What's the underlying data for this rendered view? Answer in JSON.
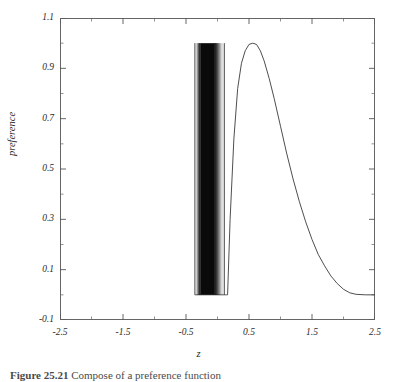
{
  "figure": {
    "caption_label": "Figure 25.21",
    "caption_text": "Compose of a preference function"
  },
  "axes": {
    "xlabel": "z",
    "ylabel": "preference",
    "x_ticks": [
      "-2.5",
      "-1.5",
      "-0.5",
      "0.5",
      "1.5",
      "2.5"
    ],
    "y_ticks": [
      "1.1",
      "0.9",
      "0.7",
      "0.5",
      "0.3",
      "0.1",
      "-0.1"
    ],
    "line_color": "#333333",
    "frame_color": "#555555"
  },
  "chart_data": {
    "type": "line",
    "title": "",
    "subtitle": "",
    "xlabel": "z",
    "ylabel": "preference",
    "xlim": [
      -2.5,
      2.5
    ],
    "ylim": [
      -0.1,
      1.1
    ],
    "xticks": [
      -2.5,
      -1.5,
      -0.5,
      0.5,
      1.5,
      2.5
    ],
    "yticks": [
      -0.1,
      0.1,
      0.3,
      0.5,
      0.7,
      0.9,
      1.1
    ],
    "minor_ticks": true,
    "grid": false,
    "legend": null,
    "series": [
      {
        "name": "oscillating preference band",
        "description": "Extremely high-frequency oscillation between 0 and 1 forming a solid dark vertical band",
        "x_range": [
          -0.36,
          0.11
        ],
        "y_range": [
          0.0,
          1.0
        ],
        "dense_core_x_range": [
          -0.27,
          -0.05
        ]
      },
      {
        "name": "smooth preference lobe",
        "description": "Smooth bell-like lobe rising from 0 near z=0.16, peaking at 1.0 near z=0.62, decaying to 0 by z=2.2",
        "x": [
          0.16,
          0.2,
          0.26,
          0.32,
          0.38,
          0.44,
          0.5,
          0.56,
          0.62,
          0.68,
          0.74,
          0.82,
          0.9,
          1.0,
          1.1,
          1.2,
          1.3,
          1.4,
          1.5,
          1.6,
          1.7,
          1.8,
          1.9,
          2.0,
          2.1,
          2.2,
          2.35,
          2.5
        ],
        "y": [
          0.0,
          0.3,
          0.62,
          0.82,
          0.92,
          0.97,
          0.995,
          1.0,
          0.995,
          0.97,
          0.93,
          0.86,
          0.78,
          0.67,
          0.56,
          0.46,
          0.37,
          0.29,
          0.22,
          0.16,
          0.115,
          0.075,
          0.045,
          0.022,
          0.008,
          0.002,
          0.0,
          0.0
        ]
      },
      {
        "name": "baseline",
        "description": "Flat zero baseline segments outside the active support",
        "x": [
          -0.36,
          0.16
        ],
        "y": [
          0.0,
          0.0
        ]
      }
    ]
  }
}
